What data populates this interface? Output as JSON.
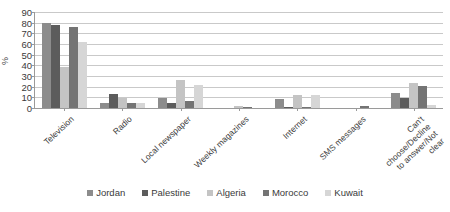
{
  "chart_data": {
    "type": "bar",
    "title": "",
    "subtitle": "",
    "xlabel": "",
    "ylabel": "%",
    "ylim": [
      0,
      90
    ],
    "yticks": [
      0,
      10,
      20,
      30,
      40,
      50,
      60,
      70,
      80,
      90
    ],
    "grid": true,
    "legend_position": "bottom",
    "categories": [
      "Television",
      "Radio",
      "Local newspaper",
      "Weekly magazines",
      "Internet",
      "SMS messages",
      "Can't choose/Decline\nto answer/Not clear"
    ],
    "series": [
      {
        "name": "Jordan",
        "color": "#8c8c8c",
        "values": [
          80,
          5,
          9,
          0,
          8,
          0,
          14
        ]
      },
      {
        "name": "Palestine",
        "color": "#5c5c5c",
        "values": [
          78,
          13,
          5,
          0,
          1,
          0,
          9
        ]
      },
      {
        "name": "Algeria",
        "color": "#c4c4c4",
        "values": [
          38,
          9,
          26,
          2,
          12,
          0,
          23
        ]
      },
      {
        "name": "Morocco",
        "color": "#747474",
        "values": [
          76,
          5,
          7,
          1,
          1,
          2,
          21
        ]
      },
      {
        "name": "Kuwait",
        "color": "#d6d6d6",
        "values": [
          62,
          5,
          22,
          0,
          12,
          0,
          3
        ]
      }
    ]
  },
  "axis": {
    "y_title": "%",
    "tick_labels": [
      "90",
      "80",
      "70",
      "60",
      "50",
      "40",
      "30",
      "20",
      "10",
      "0"
    ]
  },
  "legend": {
    "items": [
      {
        "label": "Jordan"
      },
      {
        "label": "Palestine"
      },
      {
        "label": "Algeria"
      },
      {
        "label": "Morocco"
      },
      {
        "label": "Kuwait"
      }
    ]
  }
}
